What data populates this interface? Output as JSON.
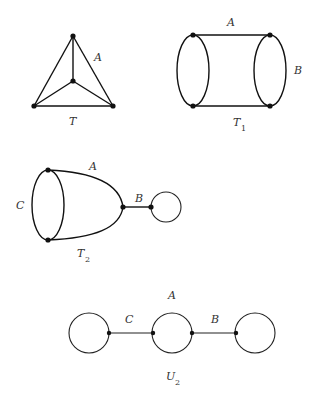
{
  "diagram": {
    "graphs": [
      {
        "name": "T",
        "labels": {
          "edge": "A",
          "caption": "T"
        }
      },
      {
        "name": "T1",
        "labels": {
          "top": "A",
          "right": "B",
          "caption": "T",
          "caption_sub": "1"
        }
      },
      {
        "name": "T2",
        "labels": {
          "left": "C",
          "top": "A",
          "bridge": "B",
          "caption": "T",
          "caption_sub": "2"
        }
      },
      {
        "name": "U2",
        "labels": {
          "top": "A",
          "left_bridge": "C",
          "right_bridge": "B",
          "caption": "U",
          "caption_sub": "2"
        }
      }
    ]
  }
}
